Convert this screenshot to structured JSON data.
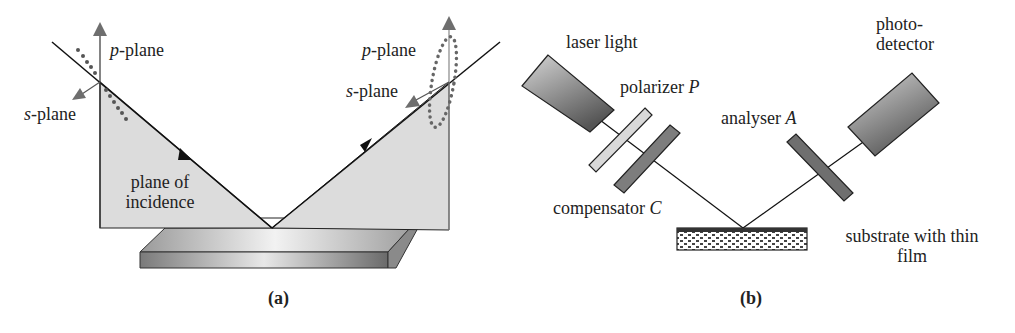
{
  "panel_a": {
    "caption": "(a)",
    "labels": {
      "p_plane_left_italic": "p",
      "p_plane_left_rest": "-plane",
      "s_plane_left_italic": "s",
      "s_plane_left_rest": "-plane",
      "p_plane_right_italic": "p",
      "p_plane_right_rest": "-plane",
      "s_plane_right_italic": "s",
      "s_plane_right_rest": "-plane",
      "plane_of_incidence_line1": "plane of",
      "plane_of_incidence_line2": "incidence"
    }
  },
  "panel_b": {
    "caption": "(b)",
    "labels": {
      "laser": "laser light",
      "polarizer": "polarizer",
      "polarizer_symbol": "P",
      "compensator": "compensator",
      "compensator_symbol": "C",
      "analyser": "analyser",
      "analyser_symbol": "A",
      "photodetector_line1": "photo-",
      "photodetector_line2": "detector",
      "substrate_line1": "substrate with thin",
      "substrate_line2": "film"
    }
  },
  "colors": {
    "plane_fill": "#dcdcdc",
    "arrow_gray": "#6e6e6e",
    "dot_gray": "#666666",
    "line": "#1a1a1a",
    "polarizer_fill": "#d9d9d9",
    "compensator_fill": "#7d7d7d",
    "analyser_fill": "#6f6f6f"
  }
}
